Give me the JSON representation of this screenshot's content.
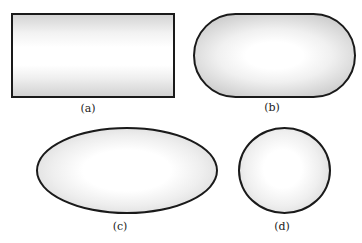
{
  "figure": {
    "panels": [
      {
        "id": "a",
        "label": "(a)",
        "shape": "rectangle"
      },
      {
        "id": "b",
        "label": "(b)",
        "shape": "stadium (rounded rectangle)"
      },
      {
        "id": "c",
        "label": "(c)",
        "shape": "ellipse"
      },
      {
        "id": "d",
        "label": "(d)",
        "shape": "circle"
      }
    ],
    "colors": {
      "outline": "#1a1a1a",
      "fill_center": "#ffffff",
      "fill_edge": "#cccccc"
    }
  }
}
